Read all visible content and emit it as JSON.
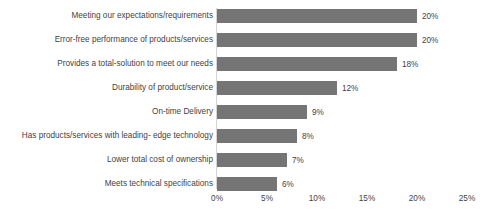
{
  "chart_data": {
    "type": "bar",
    "orientation": "horizontal",
    "title": "",
    "subtitle": "",
    "xlabel": "",
    "ylabel": "",
    "xlim": [
      0,
      25
    ],
    "grid": false,
    "legend": null,
    "bar_color": "#757575",
    "text_color": "#3f3f3f",
    "background": "#ffffff",
    "axis_line_color": "#d4d4d4",
    "tick_labels": [
      "0%",
      "5%",
      "10%",
      "15%",
      "20%",
      "25%"
    ],
    "tick_values": [
      0,
      5,
      10,
      15,
      20,
      25
    ],
    "categories": [
      "Meeting our expectations/requirements",
      "Error-free performance of products/services",
      "Provides a total-solution to meet our needs",
      "Durability of product/service",
      "On-time Delivery",
      "Has products/services with leading- edge technology",
      "Lower total cost of ownership",
      "Meets technical specifications"
    ],
    "values": [
      20,
      20,
      18,
      12,
      9,
      8,
      7,
      6
    ],
    "data_labels": [
      "20%",
      "20%",
      "18%",
      "12%",
      "9%",
      "8%",
      "7%",
      "6%"
    ]
  }
}
